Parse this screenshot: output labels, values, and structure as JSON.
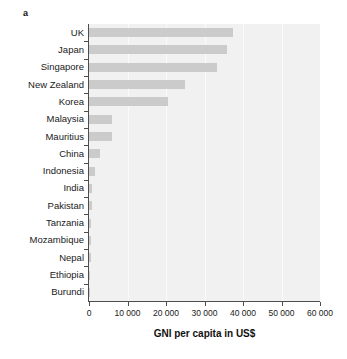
{
  "panel": {
    "label": "a"
  },
  "chart_data": {
    "type": "bar",
    "orientation": "horizontal",
    "title": "",
    "subtitle": "",
    "xlabel": "GNI per capita in US$",
    "ylabel": "",
    "xlim": [
      0,
      60000
    ],
    "grid": true,
    "legend": null,
    "bar_color": "#cbcbcb",
    "plot_background": "#f1f1f1",
    "gridline_color": "#fbfbfb",
    "axis_color": "#4d4d4d",
    "xticks": [
      0,
      10000,
      20000,
      30000,
      40000,
      50000,
      60000
    ],
    "xtick_labels": [
      "0",
      "10 000",
      "20 000",
      "30 000",
      "40 000",
      "50 000",
      "60 000"
    ],
    "categories": [
      "UK",
      "Japan",
      "Singapore",
      "New Zealand",
      "Korea",
      "Malaysia",
      "Mauritius",
      "China",
      "Indonesia",
      "India",
      "Pakistan",
      "Tanzania",
      "Mozambique",
      "Nepal",
      "Ethiopia",
      "Burundi"
    ],
    "values": [
      37400,
      35800,
      33200,
      25000,
      20500,
      6100,
      6050,
      2900,
      1600,
      820,
      900,
      450,
      400,
      400,
      300,
      140
    ]
  }
}
